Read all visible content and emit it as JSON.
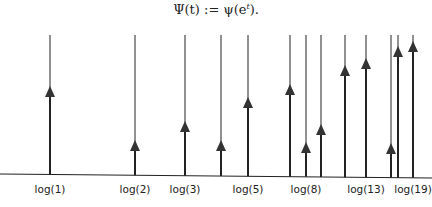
{
  "formula": {
    "text": "Ψ(t) := ψ(e^t).",
    "lhs": "Ψ(t)",
    "op": ":=",
    "rhs": "ψ(e",
    "sup": "t",
    "tail": ")."
  },
  "diagram": {
    "baseline": {
      "x1": 0,
      "y1": 174,
      "x2": 432,
      "y2": 178
    },
    "line_top": 35,
    "colors": {
      "line": "#222222",
      "arrow": "#333333"
    },
    "spikes": [
      {
        "n": 1,
        "x": 50,
        "arrow_y": 92,
        "label": "log(1)"
      },
      {
        "n": 2,
        "x": 135,
        "arrow_y": 146,
        "label": "log(2)"
      },
      {
        "n": 3,
        "x": 185,
        "arrow_y": 127,
        "label": "log(3)"
      },
      {
        "n": 4,
        "x": 221,
        "arrow_y": 146,
        "label": ""
      },
      {
        "n": 5,
        "x": 248,
        "arrow_y": 103,
        "label": "log(5)"
      },
      {
        "n": 7,
        "x": 290,
        "arrow_y": 90,
        "label": ""
      },
      {
        "n": 8,
        "x": 306,
        "arrow_y": 148,
        "label": "log(8)"
      },
      {
        "n": 9,
        "x": 321,
        "arrow_y": 130,
        "label": ""
      },
      {
        "n": 11,
        "x": 345,
        "arrow_y": 71,
        "label": ""
      },
      {
        "n": 13,
        "x": 366,
        "arrow_y": 64,
        "label": "log(13)"
      },
      {
        "n": 16,
        "x": 391,
        "arrow_y": 149,
        "label": ""
      },
      {
        "n": 17,
        "x": 398,
        "arrow_y": 52,
        "label": ""
      },
      {
        "n": 19,
        "x": 413,
        "arrow_y": 47,
        "label": "log(19)"
      }
    ]
  }
}
